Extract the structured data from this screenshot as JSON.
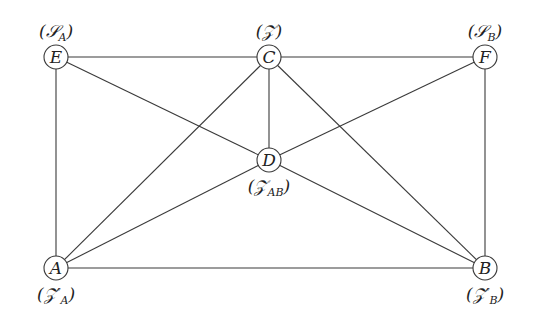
{
  "nodes": [
    {
      "id": "E",
      "label": "E",
      "annot": "(𝒮",
      "sub": "A",
      "annot_end": ")",
      "x": 56,
      "y": 57
    },
    {
      "id": "C",
      "label": "C",
      "annot": "(𝒵)",
      "sub": "",
      "annot_end": "",
      "x": 269,
      "y": 57
    },
    {
      "id": "F",
      "label": "F",
      "annot": "(𝒮",
      "sub": "B",
      "annot_end": ")",
      "x": 485,
      "y": 57
    },
    {
      "id": "D",
      "label": "D",
      "annot": "(𝒵",
      "sub": "AB",
      "annot_end": ")",
      "x": 269,
      "y": 160
    },
    {
      "id": "A",
      "label": "A",
      "annot": "(𝒵′",
      "sub": "A",
      "annot_end": ")",
      "x": 56,
      "y": 268
    },
    {
      "id": "B",
      "label": "B",
      "annot": "(𝒵′",
      "sub": "B",
      "annot_end": ")",
      "x": 485,
      "y": 268
    }
  ],
  "edges": [
    [
      "E",
      "C"
    ],
    [
      "C",
      "F"
    ],
    [
      "E",
      "A"
    ],
    [
      "F",
      "B"
    ],
    [
      "A",
      "B"
    ],
    [
      "E",
      "D"
    ],
    [
      "C",
      "D"
    ],
    [
      "F",
      "D"
    ],
    [
      "A",
      "D"
    ],
    [
      "B",
      "D"
    ],
    [
      "A",
      "C"
    ],
    [
      "C",
      "B"
    ]
  ]
}
